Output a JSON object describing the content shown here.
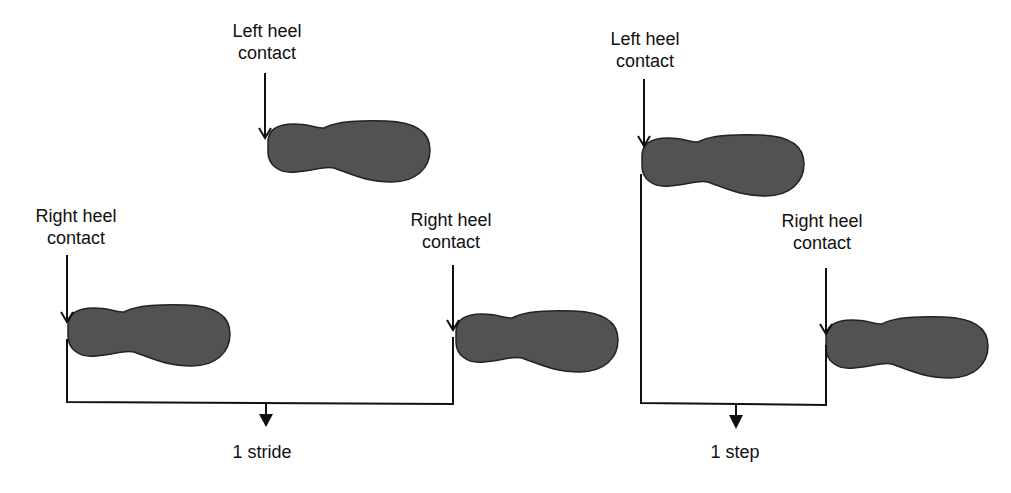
{
  "diagram": {
    "colors": {
      "footprint": "#525252",
      "line": "#111111",
      "background": "#ffffff"
    },
    "stride_panel": {
      "labels": [
        {
          "id": "left-heel-1",
          "line1": "Left heel",
          "line2": "contact"
        },
        {
          "id": "right-heel-1",
          "line1": "Right heel",
          "line2": "contact"
        },
        {
          "id": "right-heel-2",
          "line1": "Right heel",
          "line2": "contact"
        }
      ],
      "measure_label": "1 stride"
    },
    "step_panel": {
      "labels": [
        {
          "id": "left-heel-2",
          "line1": "Left heel",
          "line2": "contact"
        },
        {
          "id": "right-heel-3",
          "line1": "Right heel",
          "line2": "contact"
        }
      ],
      "measure_label": "1 step"
    }
  }
}
